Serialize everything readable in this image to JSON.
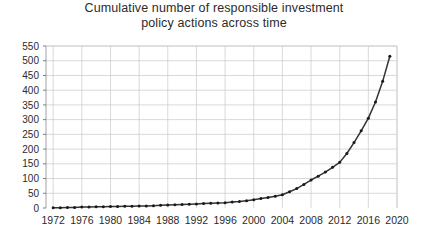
{
  "chart_data": {
    "type": "line",
    "title": "Cumulative number of responsible investment policy actions across time",
    "title_lines": [
      "Cumulative number of responsible investment",
      "policy actions across time"
    ],
    "xlabel": "",
    "ylabel": "",
    "xlim": [
      1971,
      2020
    ],
    "ylim": [
      0,
      550
    ],
    "y_ticks": [
      0,
      50,
      100,
      150,
      200,
      250,
      300,
      350,
      400,
      450,
      500,
      550
    ],
    "y_tick_labels": [
      "0",
      "50",
      "100",
      "150",
      "200",
      "250",
      "300",
      "350",
      "400",
      "450",
      "500",
      "550"
    ],
    "x_ticks": [
      1972,
      1976,
      1980,
      1984,
      1988,
      1992,
      1996,
      2000,
      2004,
      2008,
      2012,
      2016,
      2020
    ],
    "x_tick_labels": [
      "1972",
      "1976",
      "1980",
      "1984",
      "1988",
      "1992",
      "1996",
      "2000",
      "2004",
      "2008",
      "2012",
      "2016",
      "2020"
    ],
    "grid": true,
    "legend": false,
    "marker": "circle",
    "line_color": "#333333",
    "marker_color": "#1a1a1a",
    "grid_color": "#c8c8c8",
    "axis_color": "#808080",
    "x": [
      1972,
      1973,
      1974,
      1975,
      1976,
      1977,
      1978,
      1979,
      1980,
      1981,
      1982,
      1983,
      1984,
      1985,
      1986,
      1987,
      1988,
      1989,
      1990,
      1991,
      1992,
      1993,
      1994,
      1995,
      1996,
      1997,
      1998,
      1999,
      2000,
      2001,
      2002,
      2003,
      2004,
      2005,
      2006,
      2007,
      2008,
      2009,
      2010,
      2011,
      2012,
      2013,
      2014,
      2015,
      2016,
      2017,
      2018,
      2019
    ],
    "values": [
      1,
      1,
      2,
      2,
      3,
      3,
      4,
      4,
      5,
      5,
      6,
      6,
      7,
      7,
      8,
      9,
      10,
      11,
      12,
      13,
      14,
      15,
      16,
      17,
      18,
      20,
      22,
      25,
      28,
      32,
      36,
      40,
      45,
      55,
      66,
      80,
      95,
      108,
      122,
      138,
      155,
      185,
      222,
      262,
      305,
      360,
      430,
      515
    ],
    "series": [
      {
        "name": "Cumulative policy actions",
        "values": [
          1,
          1,
          2,
          2,
          3,
          3,
          4,
          4,
          5,
          5,
          6,
          6,
          7,
          7,
          8,
          9,
          10,
          11,
          12,
          13,
          14,
          15,
          16,
          17,
          18,
          20,
          22,
          25,
          28,
          32,
          36,
          40,
          45,
          55,
          66,
          80,
          95,
          108,
          122,
          138,
          155,
          185,
          222,
          262,
          305,
          360,
          430,
          515
        ]
      }
    ]
  }
}
